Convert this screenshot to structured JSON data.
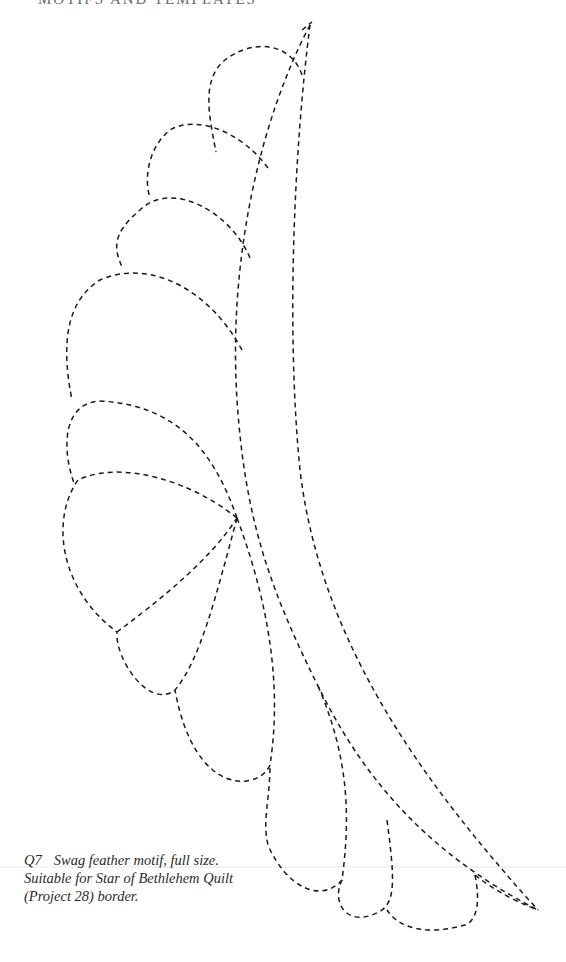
{
  "page": {
    "running_header": "MOTIFS AND TEMPLATES",
    "figure": {
      "id": "Q7",
      "caption_line1": "Swag feather motif, full size.",
      "caption_line2": "Suitable for Star of Bethlehem Quilt",
      "caption_line3": "(Project 28) border."
    },
    "motif": {
      "name": "swag-feather",
      "line_style": "dashed",
      "line_color": "#1a1a1a",
      "feather_count": 10
    }
  }
}
